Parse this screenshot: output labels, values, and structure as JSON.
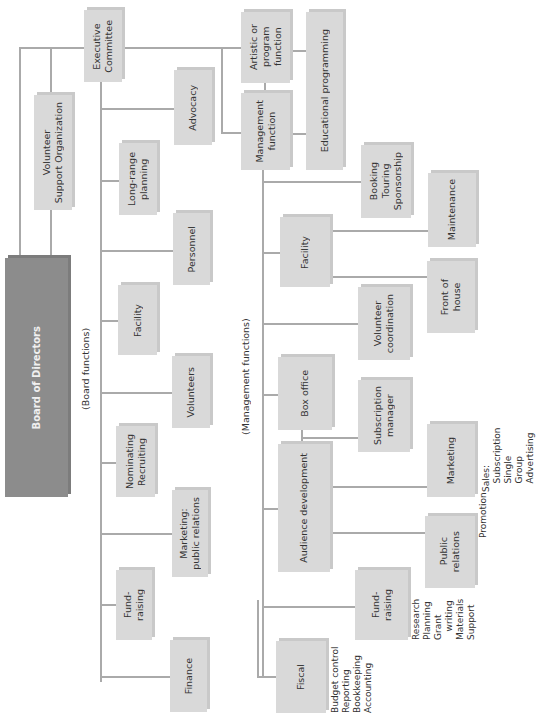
{
  "chart_title": "",
  "section_labels": {
    "board": "(Board functions)",
    "management": "(Management functions)"
  },
  "top": {
    "board_of_directors": "Board of Directors",
    "volunteer_support": "Volunteer\nSupport Organization",
    "executive_committee": "Executive\nCommittee",
    "artistic": "Artistic or\nprogram\nfunction",
    "management": "Management\nfunction",
    "educational": "Educational programming"
  },
  "board_functions": [
    "Advocacy",
    "Long-range\nplanning",
    "Personnel",
    "Facility",
    "Volunteers",
    "Nominating\nRecruiting",
    "Marketing:\npublic relations",
    "Fund-\nraising",
    "Finance"
  ],
  "management_functions": {
    "booking": "Booking\nTouring\nSponsorship",
    "facility": "Facility",
    "maintenance": "Maintenance",
    "front_of_house": "Front of\nhouse",
    "volunteer_coordination": "Volunteer\ncoordination",
    "box_office": "Box office",
    "subscription_manager": "Subscription\nmanager",
    "audience_development": "Audience development",
    "marketing": "Marketing",
    "public_relations": "Public\nrelations",
    "fundraising": "Fund-\nraising",
    "fiscal": "Fiscal"
  },
  "notes": {
    "marketing": "Sales:\n   Subscription\n   Single\n   Group\n   Advertising",
    "public_relations": "Promotion",
    "fundraising": "Research\nPlanning\nGrant\n   writing\nMaterials\nSupport",
    "fiscal": "Budget control\nReporting\nBookkeeping\nAccounting"
  }
}
